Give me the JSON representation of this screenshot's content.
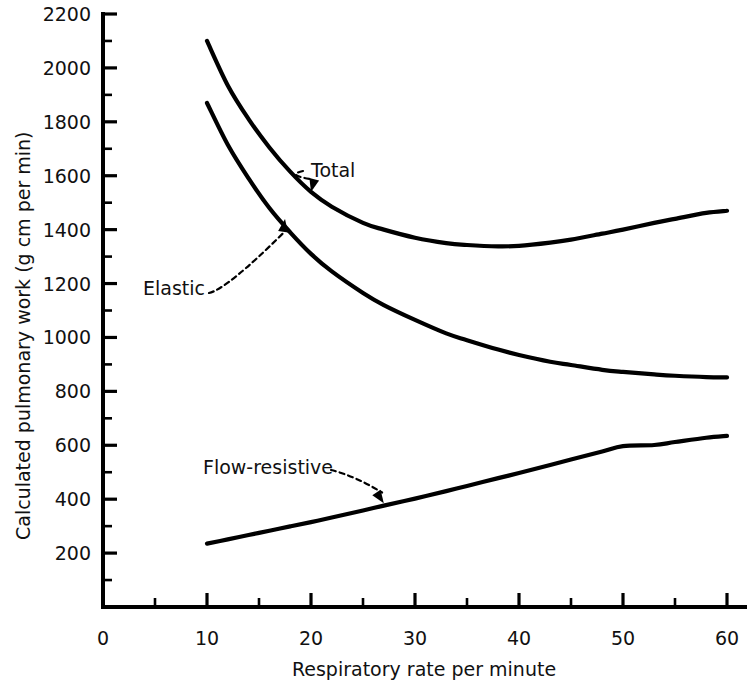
{
  "chart_data": {
    "type": "line",
    "title": "",
    "xlabel": "Respiratory rate per minute",
    "ylabel": "Calculated pulmonary work (g cm per min)",
    "xlim": [
      0,
      60
    ],
    "ylim": [
      0,
      2200
    ],
    "grid": false,
    "legend_position": "inline-annotations",
    "x_ticks": [
      0,
      10,
      20,
      30,
      40,
      50,
      60
    ],
    "x_tick_labels": [
      "0",
      "10",
      "20",
      "30",
      "40",
      "50",
      "60"
    ],
    "x_minor_tick_interval": 5,
    "y_ticks": [
      200,
      400,
      600,
      800,
      1000,
      1200,
      1400,
      1600,
      1800,
      2000,
      2200
    ],
    "y_tick_labels": [
      "200",
      "400",
      "600",
      "800",
      "1000",
      "1200",
      "1400",
      "1600",
      "1800",
      "2000",
      "2200"
    ],
    "y_minor_tick_interval": 100,
    "x": [
      10,
      12,
      14,
      16,
      18,
      20,
      22,
      25,
      27,
      30,
      33,
      35,
      38,
      40,
      43,
      45,
      48,
      50,
      53,
      55,
      58,
      60
    ],
    "series": [
      {
        "name": "Total",
        "label": "Total",
        "color": "#000000",
        "values": [
          2100,
          1935,
          1810,
          1705,
          1615,
          1540,
          1485,
          1425,
          1400,
          1370,
          1350,
          1343,
          1338,
          1340,
          1352,
          1363,
          1385,
          1400,
          1425,
          1440,
          1462,
          1470
        ]
      },
      {
        "name": "Elastic",
        "label": "Elastic",
        "color": "#000000",
        "values": [
          1870,
          1715,
          1590,
          1480,
          1390,
          1310,
          1245,
          1165,
          1120,
          1065,
          1015,
          990,
          955,
          935,
          910,
          898,
          880,
          872,
          863,
          858,
          853,
          852
        ]
      },
      {
        "name": "Flow-resistive",
        "label": "Flow-resistive",
        "color": "#000000",
        "values": [
          235,
          251,
          267,
          283,
          299,
          315,
          332,
          358,
          376,
          402,
          430,
          449,
          478,
          497,
          527,
          547,
          577,
          597,
          601,
          612,
          628,
          635
        ]
      }
    ],
    "annotations": [
      {
        "label": "Total",
        "text_x": 311,
        "text_y": 177,
        "point_x": 20,
        "point_y": 1540,
        "arrow_direction": "down-left"
      },
      {
        "label": "Elastic",
        "text_x": 143,
        "text_y": 295,
        "point_x": 17.5,
        "point_y": 1440,
        "arrow_direction": "up-right"
      },
      {
        "label": "Flow-resistive",
        "text_x": 203,
        "text_y": 474,
        "point_x": 27,
        "point_y": 385,
        "arrow_direction": "down-right"
      }
    ]
  },
  "colors": {
    "background": "#ffffff",
    "axis": "#000000",
    "curve": "#000000",
    "text": "#111111"
  }
}
